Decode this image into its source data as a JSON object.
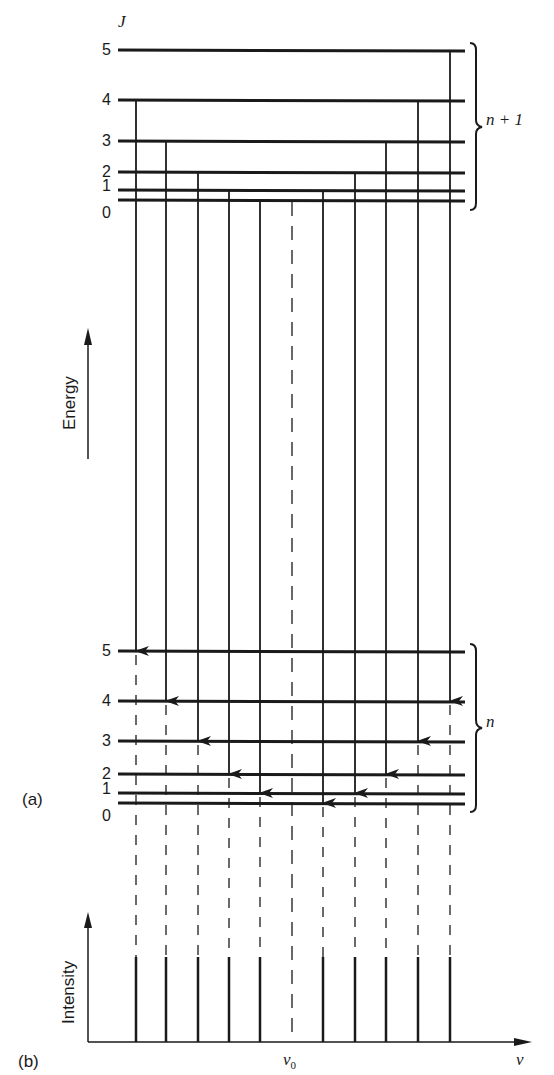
{
  "figure": {
    "panel_a_label": "(a)",
    "panel_b_label": "(b)",
    "j_axis_label": "J",
    "energy_label": "Energy",
    "intensity_label": "Intensity",
    "nu_label": "ν",
    "nu0_label": "ν",
    "nu0_sub": "0",
    "upper_band_label": "n + 1",
    "lower_band_label": "n",
    "upper_levels": [
      {
        "J": "5",
        "y": 50
      },
      {
        "J": "4",
        "y": 100
      },
      {
        "J": "3",
        "y": 141
      },
      {
        "J": "2",
        "y": 172
      },
      {
        "J": "1",
        "y": 190
      },
      {
        "J": "0",
        "y": 200
      }
    ],
    "lower_levels": [
      {
        "J": "5",
        "y": 651
      },
      {
        "J": "4",
        "y": 701
      },
      {
        "J": "3",
        "y": 741
      },
      {
        "J": "2",
        "y": 774
      },
      {
        "J": "1",
        "y": 793
      },
      {
        "J": "0",
        "y": 803
      }
    ],
    "transitions": [
      {
        "x": 136,
        "from_J": 4,
        "to_J": 5,
        "branch": "P"
      },
      {
        "x": 166,
        "from_J": 3,
        "to_J": 4,
        "branch": "P"
      },
      {
        "x": 198,
        "from_J": 2,
        "to_J": 3,
        "branch": "P"
      },
      {
        "x": 229,
        "from_J": 1,
        "to_J": 2,
        "branch": "P"
      },
      {
        "x": 260,
        "from_J": 0,
        "to_J": 1,
        "branch": "P"
      },
      {
        "x": 323,
        "from_J": 1,
        "to_J": 0,
        "branch": "R"
      },
      {
        "x": 355,
        "from_J": 2,
        "to_J": 1,
        "branch": "R"
      },
      {
        "x": 386,
        "from_J": 3,
        "to_J": 2,
        "branch": "R"
      },
      {
        "x": 418,
        "from_J": 4,
        "to_J": 3,
        "branch": "R"
      },
      {
        "x": 450,
        "from_J": 5,
        "to_J": 4,
        "branch": "R"
      }
    ],
    "band_origin_x": 292
  },
  "chart_data": {
    "type": "bar",
    "xlabel": "ν",
    "ylabel": "Intensity",
    "categories": [
      "P(5)",
      "P(4)",
      "P(3)",
      "P(2)",
      "P(1)",
      "ν0",
      "R(0)",
      "R(1)",
      "R(2)",
      "R(3)",
      "R(4)"
    ],
    "values": [
      1,
      1,
      1,
      1,
      1,
      0,
      1,
      1,
      1,
      1,
      1
    ],
    "annotations": [
      "ν0 marked with dashed line (missing Q-branch)",
      "equally spaced lines"
    ],
    "grid": false
  }
}
